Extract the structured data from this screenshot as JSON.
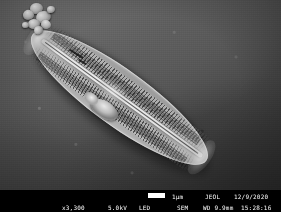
{
  "micrograph": {
    "alt_description": "Scanning electron micrograph of an elongated lanceolate diatom frustule oriented diagonally from upper-left to lower-right, showing transverse striae, a central raphe and adhering debris particles at the apical end",
    "background_color": "#4f4f4f",
    "specimen_color": "#a8a8a8"
  },
  "info_bar": {
    "magnification": "x3,300",
    "accelerating_voltage": "5.0kV",
    "detector": "LED",
    "scale_bar_label": "1µm",
    "imaging_mode": "SEM",
    "vendor": "JEOL",
    "working_distance": "WD 9.9mm",
    "date": "12/9/2020",
    "time": "15:28:16",
    "background_color": "#000000",
    "text_color": "#ffffff",
    "scale_bar_color": "#ffffff"
  }
}
